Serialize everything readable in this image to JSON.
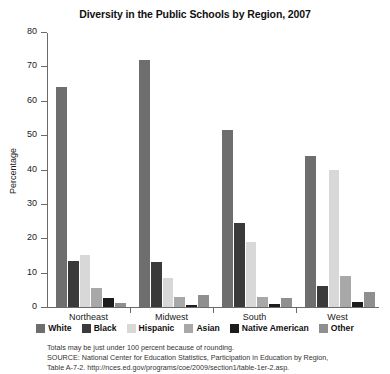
{
  "chart_data": {
    "type": "bar",
    "title": "Diversity in the Public Schools by Region, 2007",
    "xlabel": "",
    "ylabel": "Percentage",
    "ylim": [
      0,
      80
    ],
    "yticks": [
      0,
      10,
      20,
      30,
      40,
      50,
      60,
      70,
      80
    ],
    "grid": false,
    "legend_position": "bottom",
    "categories": [
      "Northeast",
      "Midwest",
      "South",
      "West"
    ],
    "series": [
      {
        "name": "White",
        "color": "#6e6e6e",
        "values": [
          64,
          72,
          51.5,
          44
        ]
      },
      {
        "name": "Black",
        "color": "#3a3a3a",
        "values": [
          13.5,
          13,
          24.5,
          6
        ]
      },
      {
        "name": "Hispanic",
        "color": "#d8d8d8",
        "values": [
          15,
          8.5,
          19,
          40
        ]
      },
      {
        "name": "Asian",
        "color": "#a8a8a8",
        "values": [
          5.5,
          3,
          3,
          9
        ]
      },
      {
        "name": "Native American",
        "color": "#1c1c1c",
        "values": [
          2.5,
          0.7,
          1,
          1.5
        ]
      },
      {
        "name": "Other",
        "color": "#8f8f8f",
        "values": [
          1.2,
          3.5,
          2.5,
          4.5
        ]
      }
    ],
    "notes": [
      "Totals may be just under 100 percent because of rounding.",
      "SOURCE: National Center for Education Statistics, Participation in Education by Region,",
      "Table A-7-2. http://nces.ed.gov/programs/coe/2009/section1/table-1er-2.asp."
    ]
  }
}
